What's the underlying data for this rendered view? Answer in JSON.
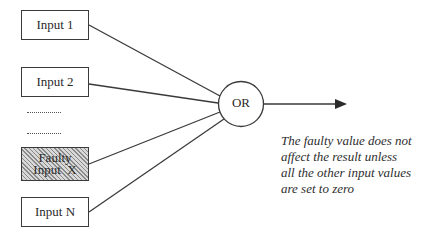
{
  "diagram": {
    "type": "OR gate fault tolerance",
    "inputs": [
      {
        "id": "input-1",
        "label": "Input 1",
        "faulty": false
      },
      {
        "id": "input-2",
        "label": "Input 2",
        "faulty": false
      },
      {
        "id": "input-x",
        "label_line1": "Faulty",
        "label_line2": "Input  X",
        "faulty": true
      },
      {
        "id": "input-n",
        "label": "Input N",
        "faulty": false
      }
    ],
    "ellipsis": [
      "..........",
      ".........."
    ],
    "gate": {
      "label": "OR"
    },
    "output": {
      "arrow": "right-arrow"
    },
    "caption": {
      "lines": [
        "The faulty value does not",
        "affect the result unless",
        "all the other input values",
        "are set to zero"
      ]
    },
    "colors": {
      "stroke": "#3a3a3a",
      "faulty_fill": "#b5b5b5",
      "background": "#ffffff"
    }
  }
}
